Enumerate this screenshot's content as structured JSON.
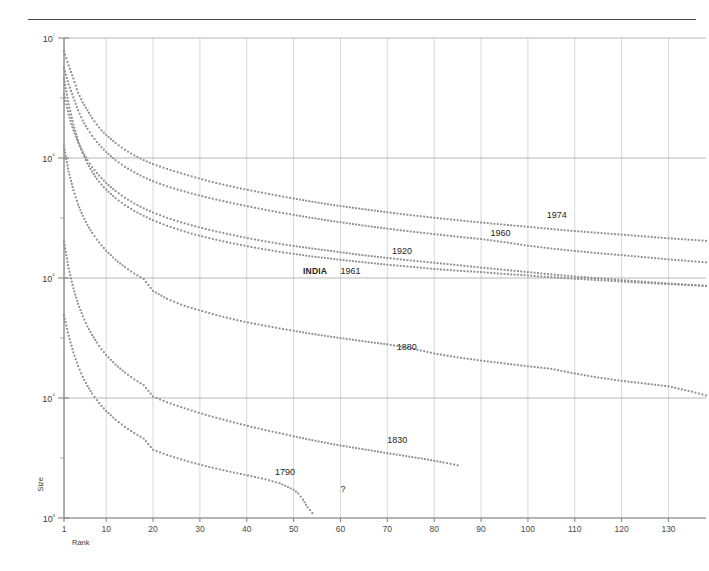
{
  "figure": {
    "top_rule": true,
    "background": "#ffffff",
    "dot_color": "#8c8c92",
    "grid_color": "#9a9a9a"
  },
  "chart_data": {
    "type": "line",
    "title": "",
    "subtitle": "",
    "xlabel": "Rank",
    "ylabel": "Size",
    "xlim": [
      1,
      138
    ],
    "ylim": [
      1000,
      10000000
    ],
    "yscale": "log",
    "xscale": "linear",
    "grid": true,
    "legend_position": "inline-annotations",
    "xticks": [
      1,
      10,
      20,
      30,
      40,
      50,
      60,
      70,
      80,
      90,
      100,
      110,
      120,
      130
    ],
    "xtick_labels": [
      "1",
      "10",
      "20",
      "30",
      "40",
      "50",
      "60",
      "70",
      "80",
      "90",
      "100",
      "110",
      "120",
      "130"
    ],
    "yticks": [
      1000,
      10000,
      100000,
      1000000,
      10000000
    ],
    "ytick_labels": [
      "10³",
      "10⁴",
      "10⁵",
      "10⁶",
      "10⁷"
    ],
    "annotations": [
      {
        "text": "1974",
        "x": 104,
        "y": 330000
      },
      {
        "text": "1960",
        "x": 92,
        "y": 232000
      },
      {
        "text": "1920",
        "x": 71,
        "y": 166000
      },
      {
        "text": "INDIA",
        "x": 52,
        "y": 112000,
        "bold": true
      },
      {
        "text": "1961",
        "x": 60,
        "y": 112000
      },
      {
        "text": "1880",
        "x": 72,
        "y": 26000
      },
      {
        "text": "1830",
        "x": 70,
        "y": 4400
      },
      {
        "text": "1790",
        "x": 46,
        "y": 2350
      },
      {
        "text": "?",
        "x": 60,
        "y": 1700
      }
    ],
    "series": [
      {
        "name": "1974",
        "label": "1974",
        "points": [
          [
            1,
            7800000
          ],
          [
            2,
            5900000
          ],
          [
            3,
            4600000
          ],
          [
            4,
            3500000
          ],
          [
            5,
            2900000
          ],
          [
            6,
            2500000
          ],
          [
            7,
            2150000
          ],
          [
            8,
            1900000
          ],
          [
            9,
            1700000
          ],
          [
            10,
            1560000
          ],
          [
            12,
            1330000
          ],
          [
            14,
            1170000
          ],
          [
            16,
            1050000
          ],
          [
            18,
            960000
          ],
          [
            20,
            890000
          ],
          [
            23,
            810000
          ],
          [
            26,
            745000
          ],
          [
            29,
            690000
          ],
          [
            32,
            640000
          ],
          [
            35,
            600000
          ],
          [
            38,
            565000
          ],
          [
            41,
            535000
          ],
          [
            44,
            508000
          ],
          [
            47,
            482000
          ],
          [
            50,
            460000
          ],
          [
            54,
            432000
          ],
          [
            58,
            408000
          ],
          [
            62,
            388000
          ],
          [
            66,
            370000
          ],
          [
            70,
            353000
          ],
          [
            75,
            334000
          ],
          [
            80,
            318000
          ],
          [
            85,
            303000
          ],
          [
            90,
            290000
          ],
          [
            95,
            278000
          ],
          [
            100,
            267000
          ],
          [
            105,
            256000
          ],
          [
            110,
            246000
          ],
          [
            115,
            238000
          ],
          [
            120,
            230000
          ],
          [
            125,
            222000
          ],
          [
            130,
            214000
          ],
          [
            135,
            208000
          ],
          [
            138,
            204000
          ]
        ]
      },
      {
        "name": "1960",
        "label": "1960",
        "points": [
          [
            1,
            5600000
          ],
          [
            2,
            4100000
          ],
          [
            3,
            3200000
          ],
          [
            4,
            2500000
          ],
          [
            5,
            2050000
          ],
          [
            6,
            1750000
          ],
          [
            7,
            1530000
          ],
          [
            8,
            1360000
          ],
          [
            9,
            1230000
          ],
          [
            10,
            1120000
          ],
          [
            12,
            960000
          ],
          [
            14,
            845000
          ],
          [
            16,
            760000
          ],
          [
            18,
            693000
          ],
          [
            20,
            640000
          ],
          [
            23,
            580000
          ],
          [
            26,
            535000
          ],
          [
            29,
            497000
          ],
          [
            32,
            465000
          ],
          [
            35,
            437000
          ],
          [
            38,
            412000
          ],
          [
            41,
            390000
          ],
          [
            44,
            370000
          ],
          [
            47,
            352000
          ],
          [
            50,
            336000
          ],
          [
            54,
            316000
          ],
          [
            58,
            299000
          ],
          [
            62,
            284000
          ],
          [
            66,
            270000
          ],
          [
            70,
            258000
          ],
          [
            75,
            244000
          ],
          [
            80,
            232000
          ],
          [
            85,
            221000
          ],
          [
            90,
            211000
          ],
          [
            95,
            199000
          ],
          [
            100,
            186000
          ],
          [
            105,
            176000
          ],
          [
            110,
            168000
          ],
          [
            115,
            161000
          ],
          [
            120,
            155000
          ],
          [
            125,
            149000
          ],
          [
            130,
            143000
          ],
          [
            135,
            138000
          ],
          [
            138,
            135000
          ]
        ]
      },
      {
        "name": "1920",
        "label": "1920",
        "points": [
          [
            1,
            3400000
          ],
          [
            2,
            2300000
          ],
          [
            3,
            1700000
          ],
          [
            4,
            1350000
          ],
          [
            5,
            1120000
          ],
          [
            6,
            960000
          ],
          [
            7,
            840000
          ],
          [
            8,
            750000
          ],
          [
            9,
            680000
          ],
          [
            10,
            620000
          ],
          [
            12,
            530000
          ],
          [
            14,
            466000
          ],
          [
            16,
            418000
          ],
          [
            18,
            381000
          ],
          [
            20,
            351000
          ],
          [
            23,
            317000
          ],
          [
            26,
            291000
          ],
          [
            29,
            270000
          ],
          [
            32,
            252000
          ],
          [
            35,
            237000
          ],
          [
            38,
            224000
          ],
          [
            41,
            212000
          ],
          [
            44,
            202000
          ],
          [
            47,
            193000
          ],
          [
            50,
            185000
          ],
          [
            54,
            176000
          ],
          [
            58,
            168000
          ],
          [
            62,
            160000
          ],
          [
            66,
            153000
          ],
          [
            70,
            147000
          ],
          [
            75,
            140000
          ],
          [
            80,
            134000
          ],
          [
            85,
            128000
          ],
          [
            90,
            122000
          ],
          [
            95,
            117000
          ],
          [
            100,
            112000
          ],
          [
            105,
            107000
          ],
          [
            110,
            103000
          ],
          [
            115,
            99500
          ],
          [
            120,
            96000
          ],
          [
            125,
            93000
          ],
          [
            130,
            90000
          ],
          [
            135,
            87500
          ],
          [
            138,
            86000
          ]
        ]
      },
      {
        "name": "INDIA 1961",
        "label": "INDIA 1961",
        "points": [
          [
            1,
            4600000
          ],
          [
            2,
            2800000
          ],
          [
            3,
            1900000
          ],
          [
            4,
            1400000
          ],
          [
            5,
            1100000
          ],
          [
            6,
            900000
          ],
          [
            7,
            770000
          ],
          [
            8,
            670000
          ],
          [
            9,
            600000
          ],
          [
            10,
            545000
          ],
          [
            12,
            462000
          ],
          [
            14,
            405000
          ],
          [
            16,
            362000
          ],
          [
            18,
            330000
          ],
          [
            20,
            303000
          ],
          [
            23,
            272000
          ],
          [
            26,
            249000
          ],
          [
            29,
            230000
          ],
          [
            32,
            215000
          ],
          [
            35,
            202000
          ],
          [
            38,
            191000
          ],
          [
            41,
            181000
          ],
          [
            44,
            173000
          ],
          [
            47,
            165000
          ],
          [
            50,
            159000
          ],
          [
            54,
            151000
          ],
          [
            58,
            145000
          ],
          [
            62,
            139000
          ],
          [
            66,
            134000
          ],
          [
            70,
            129000
          ],
          [
            75,
            124000
          ],
          [
            80,
            119000
          ],
          [
            85,
            115000
          ],
          [
            90,
            112000
          ],
          [
            95,
            108000
          ],
          [
            100,
            105000
          ],
          [
            105,
            101500
          ],
          [
            110,
            98500
          ],
          [
            115,
            96000
          ],
          [
            120,
            93500
          ],
          [
            125,
            91000
          ],
          [
            130,
            89000
          ],
          [
            135,
            87000
          ],
          [
            138,
            86000
          ]
        ]
      },
      {
        "name": "1880",
        "label": "1880",
        "points": [
          [
            1,
            1250000
          ],
          [
            2,
            770000
          ],
          [
            3,
            540000
          ],
          [
            4,
            410000
          ],
          [
            5,
            330000
          ],
          [
            6,
            276000
          ],
          [
            7,
            238000
          ],
          [
            8,
            209000
          ],
          [
            9,
            187000
          ],
          [
            10,
            169000
          ],
          [
            12,
            142000
          ],
          [
            14,
            123000
          ],
          [
            16,
            109000
          ],
          [
            18,
            98000
          ],
          [
            20,
            78000
          ],
          [
            23,
            67000
          ],
          [
            26,
            60000
          ],
          [
            29,
            55000
          ],
          [
            32,
            51000
          ],
          [
            35,
            47500
          ],
          [
            38,
            44500
          ],
          [
            41,
            42000
          ],
          [
            44,
            40000
          ],
          [
            47,
            38000
          ],
          [
            50,
            36300
          ],
          [
            54,
            34200
          ],
          [
            58,
            32400
          ],
          [
            62,
            30800
          ],
          [
            66,
            29300
          ],
          [
            70,
            28000
          ],
          [
            75,
            26000
          ],
          [
            80,
            23500
          ],
          [
            85,
            21800
          ],
          [
            90,
            20500
          ],
          [
            95,
            19400
          ],
          [
            100,
            18400
          ],
          [
            105,
            17500
          ],
          [
            110,
            16000
          ],
          [
            115,
            14800
          ],
          [
            120,
            13900
          ],
          [
            125,
            13200
          ],
          [
            130,
            12500
          ],
          [
            135,
            11300
          ],
          [
            138,
            10500
          ]
        ]
      },
      {
        "name": "1830",
        "label": "1830",
        "points": [
          [
            1,
            200000
          ],
          [
            2,
            120000
          ],
          [
            3,
            82000
          ],
          [
            4,
            61000
          ],
          [
            5,
            48000
          ],
          [
            6,
            39500
          ],
          [
            7,
            33500
          ],
          [
            8,
            29000
          ],
          [
            9,
            25500
          ],
          [
            10,
            22800
          ],
          [
            12,
            19000
          ],
          [
            14,
            16300
          ],
          [
            16,
            14300
          ],
          [
            18,
            12800
          ],
          [
            20,
            10300
          ],
          [
            23,
            9200
          ],
          [
            26,
            8400
          ],
          [
            29,
            7700
          ],
          [
            32,
            7100
          ],
          [
            35,
            6600
          ],
          [
            38,
            6150
          ],
          [
            41,
            5750
          ],
          [
            44,
            5400
          ],
          [
            47,
            5100
          ],
          [
            50,
            4800
          ],
          [
            54,
            4450
          ],
          [
            58,
            4150
          ],
          [
            62,
            3900
          ],
          [
            66,
            3680
          ],
          [
            70,
            3470
          ],
          [
            74,
            3280
          ],
          [
            78,
            3100
          ],
          [
            82,
            2900
          ],
          [
            85,
            2750
          ]
        ]
      },
      {
        "name": "1790",
        "label": "1790",
        "points": [
          [
            1,
            49000
          ],
          [
            2,
            33000
          ],
          [
            3,
            24000
          ],
          [
            4,
            18500
          ],
          [
            5,
            15000
          ],
          [
            6,
            12600
          ],
          [
            7,
            10900
          ],
          [
            8,
            9600
          ],
          [
            9,
            8600
          ],
          [
            10,
            7800
          ],
          [
            12,
            6600
          ],
          [
            14,
            5750
          ],
          [
            16,
            5100
          ],
          [
            18,
            4600
          ],
          [
            20,
            3700
          ],
          [
            23,
            3350
          ],
          [
            26,
            3080
          ],
          [
            29,
            2850
          ],
          [
            32,
            2660
          ],
          [
            35,
            2500
          ],
          [
            38,
            2360
          ],
          [
            41,
            2230
          ],
          [
            44,
            2100
          ],
          [
            47,
            1950
          ],
          [
            50,
            1720
          ],
          [
            51,
            1600
          ],
          [
            52,
            1420
          ],
          [
            53,
            1230
          ],
          [
            54,
            1100
          ]
        ]
      }
    ]
  }
}
